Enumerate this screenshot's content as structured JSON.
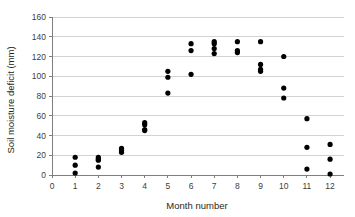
{
  "chart_data": {
    "type": "scatter",
    "title": "",
    "xlabel": "Month number",
    "ylabel": "Soil moisture deficit (mm)",
    "xlim": [
      0,
      12.6
    ],
    "ylim": [
      0,
      160
    ],
    "xticks": [
      0,
      1,
      2,
      3,
      4,
      5,
      6,
      7,
      8,
      9,
      10,
      11,
      12
    ],
    "yticks": [
      0,
      20,
      40,
      60,
      80,
      100,
      120,
      140,
      160
    ],
    "xtick_labels": [
      "0",
      "1",
      "2",
      "3",
      "4",
      "5",
      "6",
      "7",
      "8",
      "9",
      "10",
      "11",
      "12"
    ],
    "ytick_labels": [
      "0",
      "20",
      "40",
      "60",
      "80",
      "100",
      "120",
      "140",
      "160"
    ],
    "grid": "horizontal",
    "legend": "none",
    "marker": "filled-circle",
    "marker_color": "#000000",
    "series": [
      {
        "name": "Soil moisture deficit",
        "points": [
          {
            "x": 1,
            "y": 18
          },
          {
            "x": 1,
            "y": 10
          },
          {
            "x": 1,
            "y": 2
          },
          {
            "x": 2,
            "y": 18
          },
          {
            "x": 2,
            "y": 16
          },
          {
            "x": 2,
            "y": 15
          },
          {
            "x": 2,
            "y": 8
          },
          {
            "x": 3,
            "y": 27
          },
          {
            "x": 3,
            "y": 25
          },
          {
            "x": 3,
            "y": 23
          },
          {
            "x": 4,
            "y": 53
          },
          {
            "x": 4,
            "y": 51
          },
          {
            "x": 4,
            "y": 46
          },
          {
            "x": 4,
            "y": 45
          },
          {
            "x": 5,
            "y": 105
          },
          {
            "x": 5,
            "y": 99
          },
          {
            "x": 5,
            "y": 83
          },
          {
            "x": 6,
            "y": 133
          },
          {
            "x": 6,
            "y": 126
          },
          {
            "x": 6,
            "y": 102
          },
          {
            "x": 7,
            "y": 135
          },
          {
            "x": 7,
            "y": 133
          },
          {
            "x": 7,
            "y": 128
          },
          {
            "x": 7,
            "y": 123
          },
          {
            "x": 8,
            "y": 135
          },
          {
            "x": 8,
            "y": 126
          },
          {
            "x": 8,
            "y": 124
          },
          {
            "x": 9,
            "y": 135
          },
          {
            "x": 9,
            "y": 112
          },
          {
            "x": 9,
            "y": 107
          },
          {
            "x": 9,
            "y": 105
          },
          {
            "x": 10,
            "y": 120
          },
          {
            "x": 10,
            "y": 88
          },
          {
            "x": 10,
            "y": 78
          },
          {
            "x": 11,
            "y": 57
          },
          {
            "x": 11,
            "y": 28
          },
          {
            "x": 11,
            "y": 6
          },
          {
            "x": 12,
            "y": 31
          },
          {
            "x": 12,
            "y": 16
          },
          {
            "x": 12,
            "y": 1
          }
        ]
      }
    ]
  }
}
